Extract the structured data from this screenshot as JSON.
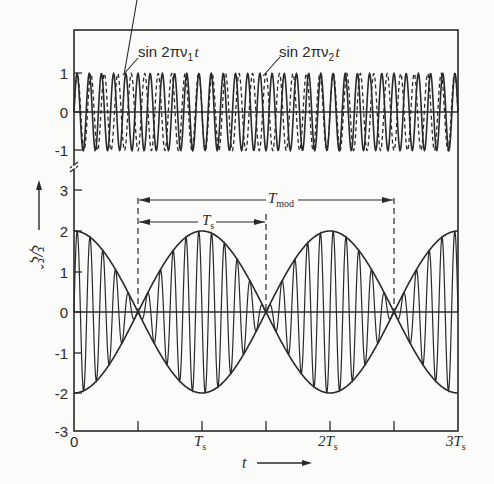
{
  "chart_data": [
    {
      "type": "line",
      "title": "",
      "panel": "upper",
      "xlabel": "t",
      "ylabel": "",
      "ylim": [
        -1,
        1
      ],
      "yticks": [
        "1",
        "0",
        "-1"
      ],
      "series": [
        {
          "name": "sin 2πν1 t",
          "style": "solid",
          "amplitude": 1,
          "frequency_per_Ts": 10.5
        },
        {
          "name": "sin 2πν2 t",
          "style": "dashed",
          "amplitude": 1,
          "frequency_per_Ts": 9.5
        }
      ],
      "annotations": [
        "sin 2πν1 t",
        "sin 2πν2 t"
      ]
    },
    {
      "type": "line",
      "panel": "lower",
      "xlabel": "t",
      "ylabel": "ξ/ξ̂",
      "xlim": [
        0,
        3
      ],
      "x_unit": "Ts",
      "xticks": [
        "0",
        "Ts",
        "2Ts",
        "3Ts"
      ],
      "ylim": [
        -3,
        3
      ],
      "yticks": [
        "3",
        "2",
        "1",
        "0",
        "-1",
        "-2",
        "-3"
      ],
      "series": [
        {
          "name": "sum signal",
          "formula": "2 cos(π t/Ts) sin(2π·10 t/Ts)",
          "amplitude": 2
        },
        {
          "name": "envelope +",
          "formula": "2|cos(π t/Ts)|"
        },
        {
          "name": "envelope -",
          "formula": "-2|cos(π t/Ts)|"
        }
      ],
      "envelope_zeros_Ts": [
        0.5,
        1.5,
        2.5
      ],
      "annotations": [
        {
          "label": "Ts",
          "from_Ts": 0.5,
          "to_Ts": 1.5
        },
        {
          "label": "Tmod",
          "from_Ts": 0.5,
          "to_Ts": 2.5
        }
      ]
    }
  ],
  "labels": {
    "sin1": "sin 2πν",
    "sin1_sub": "1",
    "sin2": "sin 2πν",
    "sin2_sub": "2",
    "t_var": "t",
    "ts_dim": "T",
    "ts_dim_sub": "s",
    "tmod_dim": "T",
    "tmod_dim_sub": "mod",
    "ylabel": "ξ/ξ̂",
    "xlabel": "t",
    "ytick_upper": [
      "1",
      "0",
      "-1"
    ],
    "ytick_lower": [
      "3",
      "2",
      "1",
      "0",
      "-1",
      "-2",
      "-3"
    ],
    "xtick": [
      "0",
      "T",
      "2T",
      "3T"
    ],
    "xtick_sub": "s"
  }
}
